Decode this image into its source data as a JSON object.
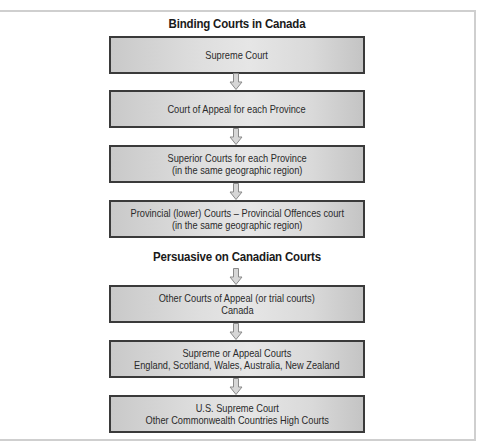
{
  "diagram": {
    "sections": [
      {
        "heading": "Binding Courts in Canada",
        "boxes": [
          {
            "line1": "Supreme Court",
            "line2": ""
          },
          {
            "line1": "Court of Appeal for each Province",
            "line2": ""
          },
          {
            "line1": "Superior Courts for each Province",
            "line2": "(in the same geographic region)"
          },
          {
            "line1": "Provincial (lower) Courts – Provincial Offences court",
            "line2": "(in the same geographic region)"
          }
        ]
      },
      {
        "heading": "Persuasive on Canadian Courts",
        "boxes": [
          {
            "line1": "Other Courts of Appeal (or trial courts)",
            "line2": "Canada"
          },
          {
            "line1": "Supreme or Appeal Courts",
            "line2": "England, Scotland, Wales, Australia, New Zealand"
          },
          {
            "line1": "U.S. Supreme Court",
            "line2": "Other Commonwealth Countries High Courts"
          }
        ]
      }
    ],
    "colors": {
      "box_border": "#3a3a3a",
      "box_fill_light": "#e6e6e6",
      "box_fill_dark": "#c4c4c4",
      "arrow_fill": "#d6d6d6",
      "arrow_stroke": "#8a8a8a",
      "frame": "#cfcfcf"
    }
  }
}
